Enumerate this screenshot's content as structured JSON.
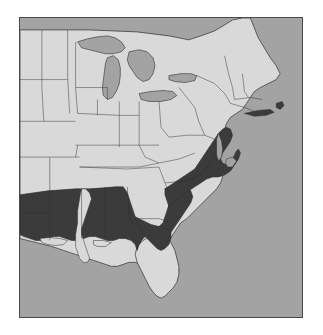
{
  "figure": {
    "type": "range-map",
    "region": "Eastern United States",
    "projection_note": "unlabeled plain outline map",
    "has_title": false,
    "has_legend": false,
    "has_axis_labels": false,
    "has_scale_bar": false,
    "has_text_labels": false
  },
  "colors": {
    "background": "#ffffff",
    "frame_border": "#4a4a4a",
    "water": "#a3a3a3",
    "land_unshaded": "#d9d9d9",
    "land_shaded_range": "#3b3b3b",
    "state_boundary": "#2e2e2e",
    "coastline": "#2e2e2e"
  },
  "frame": {
    "left": 19,
    "top": 17,
    "width": 284,
    "height": 301,
    "border_width": 1
  },
  "map_layers": [
    {
      "name": "water",
      "description": "Atlantic Ocean, Gulf of Mexico and Great Lakes rendered in medium gray",
      "color": "#a3a3a3"
    },
    {
      "name": "land-unshaded",
      "description": "United States land area outside the shaded distribution",
      "color": "#d9d9d9"
    },
    {
      "name": "land-shaded-range",
      "description": "Shaded distribution range across the southeastern coastal plain",
      "color": "#3b3b3b"
    },
    {
      "name": "state-boundaries",
      "description": "Thin dark state outlines across the mapped area",
      "color": "#2e2e2e"
    }
  ],
  "range_extent": {
    "description": "Dark shading covers the southeastern coastal plain",
    "included_areas": [
      "east Texas",
      "southern Arkansas edge",
      "Louisiana (excluding the Mississippi alluvial valley)",
      "Mississippi",
      "Alabama",
      "northern Florida",
      "Georgia coastal plain",
      "South Carolina coastal plain",
      "North Carolina coastal plain",
      "southeastern Virginia"
    ],
    "excluded_areas": [
      "Mississippi River alluvial valley",
      "southern Florida peninsula",
      "Appalachian and Piedmont uplands",
      "Midwest",
      "Northeast and New England",
      "Great Lakes states"
    ]
  },
  "great_lakes": [
    "Lake Superior",
    "Lake Michigan",
    "Lake Huron",
    "Lake Erie",
    "Lake Ontario"
  ]
}
